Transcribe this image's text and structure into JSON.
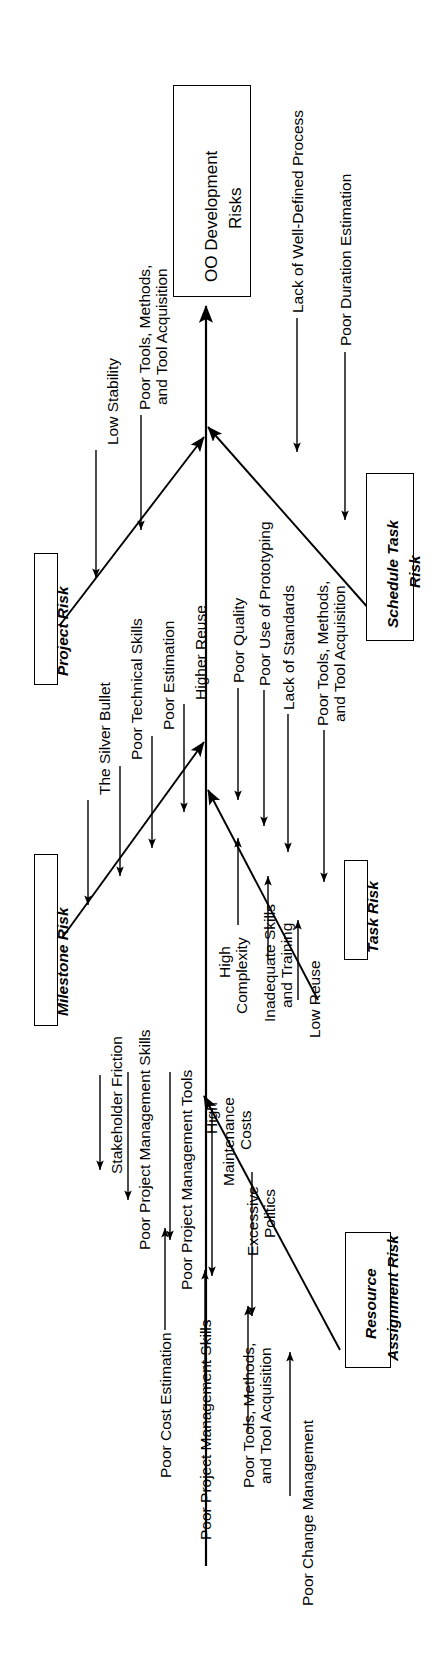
{
  "diagram": {
    "type": "fishbone-ishikawa",
    "orientation": "rotated-90-ccw",
    "effect_label": "OO Development\nRisks",
    "effect_line1": "OO Development",
    "effect_line2": "Risks",
    "line_color": "#000000",
    "background": "#ffffff",
    "categories": [
      {
        "id": "project-risk",
        "label": "Project Risk",
        "side": "left",
        "causes": [
          "Low Stability",
          "Poor Tools, Methods,",
          "and Tool Acquisition"
        ],
        "cause_groups": [
          {
            "lines": [
              "Low Stability"
            ]
          },
          {
            "lines": [
              "Poor Tools, Methods,",
              "and Tool Acquisition"
            ]
          }
        ]
      },
      {
        "id": "schedule-task-risk",
        "label": "Schedule Task\nRisk",
        "label_line1": "Schedule Task",
        "label_line2": "Risk",
        "side": "right",
        "cause_groups": [
          {
            "lines": [
              "Lack of Well-Defined Process"
            ]
          },
          {
            "lines": [
              "Poor Duration Estimation"
            ]
          }
        ]
      },
      {
        "id": "milestone-risk",
        "label": "Milestone Risk",
        "side": "left",
        "cause_groups": [
          {
            "lines": [
              "The Silver Bullet"
            ]
          },
          {
            "lines": [
              "Poor Technical Skills"
            ]
          },
          {
            "lines": [
              "Poor Estimation"
            ]
          },
          {
            "lines": [
              "Higher Reuse"
            ]
          }
        ]
      },
      {
        "id": "task-risk",
        "label": "Task Risk",
        "side": "right",
        "cause_groups": [
          {
            "lines": [
              "Poor Quality"
            ]
          },
          {
            "lines": [
              "Poor Use of Prototyping"
            ]
          },
          {
            "lines": [
              "Lack of Standards"
            ]
          },
          {
            "lines": [
              "Poor Tools, Methods,",
              "and Tool Acquisition"
            ]
          },
          {
            "lines": [
              "High",
              "Complexity"
            ]
          },
          {
            "lines": [
              "Inadequate Skills",
              "and Training"
            ]
          },
          {
            "lines": [
              "Low Reuse"
            ]
          }
        ]
      },
      {
        "id": "resource-assignment-risk",
        "label": "Resource\nAssignment Risk",
        "label_line1": "Resource",
        "label_line2": "Assignment Risk",
        "side": "left",
        "cause_groups": [
          {
            "lines": [
              "Stakeholder Friction"
            ]
          },
          {
            "lines": [
              "Poor Project Management Skills"
            ]
          },
          {
            "lines": [
              "Poor Project Management Tools"
            ]
          },
          {
            "lines": [
              "High",
              "Maintenance",
              "Costs"
            ]
          },
          {
            "lines": [
              "Excessive",
              "Politics"
            ]
          },
          {
            "lines": [
              "Poor Cost Estimation"
            ]
          },
          {
            "lines": [
              "Poor Project Management Skills"
            ]
          },
          {
            "lines": [
              "Poor Tools, Methods,",
              "and Tool Acquisition"
            ]
          },
          {
            "lines": [
              "Poor Change Management"
            ]
          }
        ]
      }
    ],
    "all_cause_labels": [
      "Low Stability",
      "Poor Tools, Methods, and Tool Acquisition",
      "Lack of Well-Defined Process",
      "Poor Duration Estimation",
      "The Silver Bullet",
      "Poor Technical Skills",
      "Poor Estimation",
      "Higher Reuse",
      "Poor Quality",
      "Poor Use of Prototyping",
      "Lack of Standards",
      "Poor Tools, Methods, and Tool Acquisition",
      "High Complexity",
      "Inadequate Skills and Training",
      "Low Reuse",
      "Stakeholder Friction",
      "Poor Project Management Skills",
      "Poor Project Management Tools",
      "High Maintenance Costs",
      "Excessive Politics",
      "Poor Cost Estimation",
      "Poor Project Management Skills",
      "Poor Tools, Methods, and Tool Acquisition",
      "Poor Change Management"
    ]
  },
  "text": {
    "c_low_stability": "Low Stability",
    "c_tools1a": "Poor Tools, Methods,",
    "c_tools1b": "and Tool Acquisition",
    "c_lack_process": "Lack of Well-Defined Process",
    "c_duration": "Poor Duration Estimation",
    "c_silver_bullet": "The Silver Bullet",
    "c_tech_skills": "Poor Technical Skills",
    "c_poor_estimation": "Poor Estimation",
    "c_higher_reuse": "Higher Reuse",
    "c_poor_quality": "Poor Quality",
    "c_prototyping": "Poor Use of Prototyping",
    "c_standards": "Lack of Standards",
    "c_tools2a": "Poor Tools, Methods,",
    "c_tools2b": "and Tool Acquisition",
    "c_high": "High",
    "c_complexity": "Complexity",
    "c_inadequate": "Inadequate Skills",
    "c_training": "and Training",
    "c_low_reuse": "Low Reuse",
    "c_stakeholder": "Stakeholder Friction",
    "c_pm_skills1": "Poor Project Management Skills",
    "c_pm_tools": "Poor Project Management Tools",
    "c_high2": "High",
    "c_maintenance": "Maintenance",
    "c_costs": "Costs",
    "c_excessive": "Excessive",
    "c_politics": "Politics",
    "c_cost_est": "Poor Cost Estimation",
    "c_pm_skills2": "Poor Project Management Skills",
    "c_tools3a": "Poor Tools, Methods,",
    "c_tools3b": "and Tool Acquisition",
    "c_change_mgmt": "Poor Change Management",
    "b_project_risk": "Project Risk",
    "b_milestone_risk": "Milestone Risk",
    "b_resource1": "Resource",
    "b_resource2": "Assignment Risk",
    "b_schedule1": "Schedule Task",
    "b_schedule2": "Risk",
    "b_task_risk": "Task Risk",
    "h_effect1": "OO Development",
    "h_effect2": "Risks"
  }
}
